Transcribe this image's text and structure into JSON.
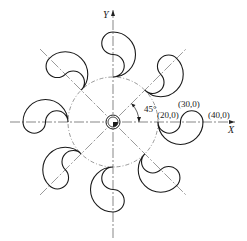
{
  "diagram": {
    "axes": {
      "x_label": "X",
      "y_label": "Y"
    },
    "angle_label": "45°",
    "point_labels": [
      "(20,0)",
      "(30,0)",
      "(40,0)"
    ],
    "pattern": {
      "petal_count": 8,
      "angular_step_deg": 45,
      "base_circle_radius": 20,
      "petal_points": [
        [
          20,
          0
        ],
        [
          30,
          0
        ],
        [
          40,
          0
        ]
      ]
    },
    "colors": {
      "line": "#1a1a1a",
      "centerline": "#555555"
    }
  }
}
